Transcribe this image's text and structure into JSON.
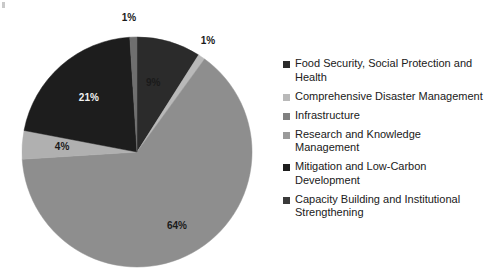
{
  "chart_data": {
    "type": "pie",
    "title": "",
    "categories": [
      "Food Security, Social Protection and Health",
      "Comprehensive Disaster Management",
      "Infrastructure",
      "Research and Knowledge Management",
      "Mitigation and Low-Carbon Development",
      "Capacity Building and Institutional Strengthening"
    ],
    "values": [
      9,
      1,
      64,
      4,
      21,
      1
    ],
    "value_labels": [
      "9%",
      "1%",
      "64%",
      "4%",
      "21%",
      "1%"
    ],
    "colors": [
      "#2b2b2b",
      "#b9b9b9",
      "#8e8e8e",
      "#b0b0b0",
      "#1d1d1d",
      "#6f6f6f"
    ],
    "legend_position": "right",
    "start_angle_deg": 0,
    "direction": "clockwise",
    "grid": false,
    "xlabel": "",
    "ylabel": ""
  },
  "pie": {
    "slices": [
      {
        "label": "9%",
        "name": "slice-food-security",
        "value": 9,
        "color": "#2b2b2b",
        "text_color": "dark"
      },
      {
        "label": "1%",
        "name": "slice-comprehensive",
        "value": 1,
        "color": "#b9b9b9",
        "text_color": "dark"
      },
      {
        "label": "64%",
        "name": "slice-infrastructure",
        "value": 64,
        "color": "#8e8e8e",
        "text_color": "dark"
      },
      {
        "label": "4%",
        "name": "slice-research",
        "value": 4,
        "color": "#b0b0b0",
        "text_color": "dark"
      },
      {
        "label": "21%",
        "name": "slice-mitigation",
        "value": 21,
        "color": "#1d1d1d",
        "text_color": "light"
      },
      {
        "label": "1%",
        "name": "slice-capacity-building",
        "value": 1,
        "color": "#6f6f6f",
        "text_color": "dark"
      }
    ]
  },
  "legend": {
    "items": [
      {
        "label": "Food Security, Social Protection and Health",
        "color": "#2b2b2b"
      },
      {
        "label": "Comprehensive Disaster Management",
        "color": "#b9b9b9"
      },
      {
        "label": "Infrastructure",
        "color": "#808080"
      },
      {
        "label": "Research and Knowledge Management",
        "color": "#9a9a9a"
      },
      {
        "label": "Mitigation and Low-Carbon Development",
        "color": "#1d1d1d"
      },
      {
        "label": "Capacity Building and Institutional Strengthening",
        "color": "#3a3a3a"
      }
    ]
  }
}
